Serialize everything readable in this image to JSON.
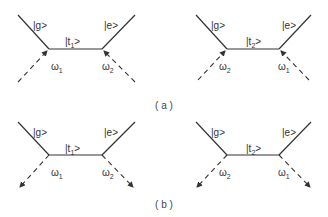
{
  "colors": {
    "line": "#333333",
    "text": "#333333",
    "background": "#ffffff"
  },
  "captions": {
    "a": "( a )",
    "b": "( b )"
  },
  "panels": [
    {
      "id": "a-left",
      "left_state": "|g>",
      "right_state": "|e>",
      "intermediate": {
        "base": "|t",
        "sub": "1",
        "close": ">"
      },
      "photon_left": {
        "base": "ω",
        "sub": "1"
      },
      "photon_right": {
        "base": "ω",
        "sub": "2"
      },
      "photon_direction": "incoming"
    },
    {
      "id": "a-right",
      "left_state": "|g>",
      "right_state": "|e>",
      "intermediate": {
        "base": "|t",
        "sub": "2",
        "close": ">"
      },
      "photon_left": {
        "base": "ω",
        "sub": "2"
      },
      "photon_right": {
        "base": "ω",
        "sub": "1"
      },
      "photon_direction": "incoming"
    },
    {
      "id": "b-left",
      "left_state": "|g>",
      "right_state": "|e>",
      "intermediate": {
        "base": "|t",
        "sub": "1",
        "close": ">"
      },
      "photon_left": {
        "base": "ω",
        "sub": "1"
      },
      "photon_right": {
        "base": "ω",
        "sub": "2"
      },
      "photon_direction": "outgoing"
    },
    {
      "id": "b-right",
      "left_state": "|g>",
      "right_state": "|e>",
      "intermediate": {
        "base": "|t",
        "sub": "2",
        "close": ">"
      },
      "photon_left": {
        "base": "ω",
        "sub": "2"
      },
      "photon_right": {
        "base": "ω",
        "sub": "1"
      },
      "photon_direction": "outgoing"
    }
  ]
}
